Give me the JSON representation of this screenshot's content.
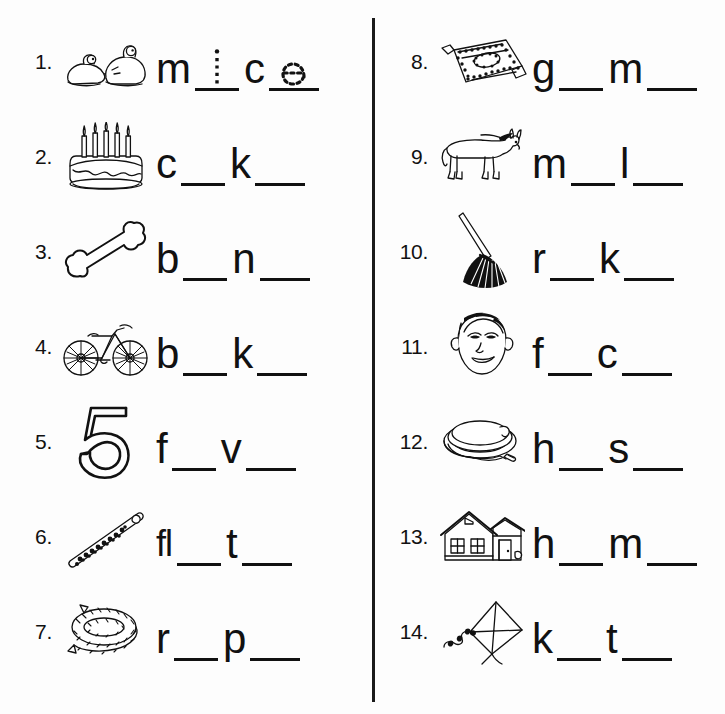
{
  "worksheet": {
    "title": "Long vowel silent-e picture word worksheet",
    "layout": "two-column",
    "divider": "vertical-rule",
    "ink_color": "#111111",
    "paper_color": "#fdfdfd"
  },
  "items": [
    {
      "number": "1.",
      "picture": "mice",
      "picture_icon": "mice-icon",
      "parts": [
        {
          "type": "letter",
          "text": "m"
        },
        {
          "type": "blank",
          "trace": "i"
        },
        {
          "type": "letter",
          "text": "c"
        },
        {
          "type": "blank",
          "trace": "e"
        }
      ]
    },
    {
      "number": "2.",
      "picture": "cake",
      "picture_icon": "cake-icon",
      "parts": [
        {
          "type": "letter",
          "text": "c"
        },
        {
          "type": "blank",
          "trace": ""
        },
        {
          "type": "letter",
          "text": "k"
        },
        {
          "type": "blank",
          "trace": ""
        }
      ]
    },
    {
      "number": "3.",
      "picture": "bone",
      "picture_icon": "bone-icon",
      "parts": [
        {
          "type": "letter",
          "text": "b"
        },
        {
          "type": "blank",
          "trace": ""
        },
        {
          "type": "letter",
          "text": "n"
        },
        {
          "type": "blank",
          "trace": ""
        }
      ]
    },
    {
      "number": "4.",
      "picture": "bike",
      "picture_icon": "bicycle-icon",
      "parts": [
        {
          "type": "letter",
          "text": "b"
        },
        {
          "type": "blank",
          "trace": ""
        },
        {
          "type": "letter",
          "text": "k"
        },
        {
          "type": "blank",
          "trace": ""
        }
      ]
    },
    {
      "number": "5.",
      "picture": "five",
      "picture_icon": "numeral-five-icon",
      "parts": [
        {
          "type": "letter",
          "text": "f"
        },
        {
          "type": "blank",
          "trace": ""
        },
        {
          "type": "letter",
          "text": "v"
        },
        {
          "type": "blank",
          "trace": ""
        }
      ]
    },
    {
      "number": "6.",
      "picture": "flute",
      "picture_icon": "flute-icon",
      "parts": [
        {
          "type": "letter",
          "text": "fl"
        },
        {
          "type": "blank",
          "trace": ""
        },
        {
          "type": "letter",
          "text": "t"
        },
        {
          "type": "blank",
          "trace": ""
        }
      ]
    },
    {
      "number": "7.",
      "picture": "rope",
      "picture_icon": "rope-icon",
      "parts": [
        {
          "type": "letter",
          "text": "r"
        },
        {
          "type": "blank",
          "trace": ""
        },
        {
          "type": "letter",
          "text": "p"
        },
        {
          "type": "blank",
          "trace": ""
        }
      ]
    },
    {
      "number": "8.",
      "picture": "game",
      "picture_icon": "game-board-icon",
      "parts": [
        {
          "type": "letter",
          "text": "g"
        },
        {
          "type": "blank",
          "trace": ""
        },
        {
          "type": "letter",
          "text": "m"
        },
        {
          "type": "blank",
          "trace": ""
        }
      ]
    },
    {
      "number": "9.",
      "picture": "mule",
      "picture_icon": "mule-icon",
      "parts": [
        {
          "type": "letter",
          "text": "m"
        },
        {
          "type": "blank",
          "trace": ""
        },
        {
          "type": "letter",
          "text": "l"
        },
        {
          "type": "blank",
          "trace": ""
        }
      ]
    },
    {
      "number": "10.",
      "picture": "rake",
      "picture_icon": "rake-icon",
      "parts": [
        {
          "type": "letter",
          "text": "r"
        },
        {
          "type": "blank",
          "trace": ""
        },
        {
          "type": "letter",
          "text": "k"
        },
        {
          "type": "blank",
          "trace": ""
        }
      ]
    },
    {
      "number": "11.",
      "picture": "face",
      "picture_icon": "face-icon",
      "parts": [
        {
          "type": "letter",
          "text": "f"
        },
        {
          "type": "blank",
          "trace": ""
        },
        {
          "type": "letter",
          "text": "c"
        },
        {
          "type": "blank",
          "trace": ""
        }
      ]
    },
    {
      "number": "12.",
      "picture": "hose",
      "picture_icon": "hose-icon",
      "parts": [
        {
          "type": "letter",
          "text": "h"
        },
        {
          "type": "blank",
          "trace": ""
        },
        {
          "type": "letter",
          "text": "s"
        },
        {
          "type": "blank",
          "trace": ""
        }
      ]
    },
    {
      "number": "13.",
      "picture": "home",
      "picture_icon": "house-icon",
      "parts": [
        {
          "type": "letter",
          "text": "h"
        },
        {
          "type": "blank",
          "trace": ""
        },
        {
          "type": "letter",
          "text": "m"
        },
        {
          "type": "blank",
          "trace": ""
        }
      ]
    },
    {
      "number": "14.",
      "picture": "kite",
      "picture_icon": "kite-icon",
      "parts": [
        {
          "type": "letter",
          "text": "k"
        },
        {
          "type": "blank",
          "trace": ""
        },
        {
          "type": "letter",
          "text": "t"
        },
        {
          "type": "blank",
          "trace": ""
        }
      ]
    }
  ]
}
